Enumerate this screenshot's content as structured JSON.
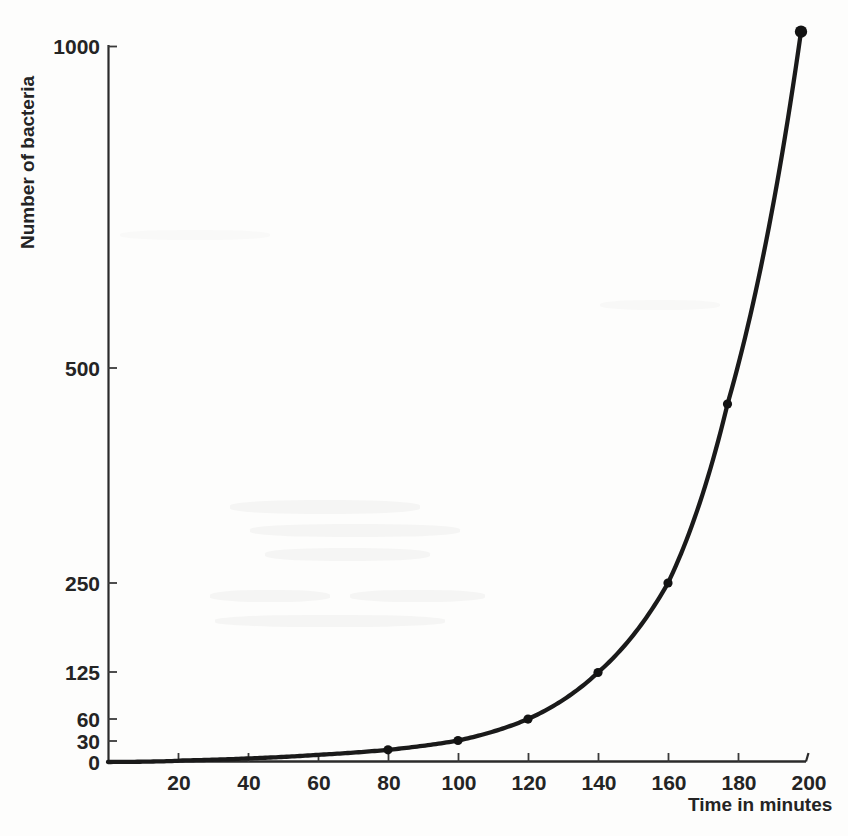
{
  "chart_data": {
    "type": "line",
    "title": "",
    "xlabel": "Time in minutes",
    "ylabel": "Number of bacteria",
    "xlim": [
      0,
      200
    ],
    "ylim": [
      0,
      1000
    ],
    "grid": false,
    "legend": "none",
    "x_ticks": [
      20,
      40,
      60,
      80,
      100,
      120,
      140,
      160,
      180,
      200
    ],
    "x_tick_labels": [
      "20",
      "40",
      "60",
      "80",
      "100",
      "120",
      "140",
      "160",
      "180",
      "200"
    ],
    "y_ticks": [
      0,
      30,
      60,
      125,
      250,
      500,
      1000
    ],
    "y_tick_labels": [
      "0",
      "30",
      "60",
      "125",
      "250",
      "500",
      "1000"
    ],
    "series": [
      {
        "name": "Number of bacteria",
        "marker": "dot",
        "x": [
          0,
          20,
          40,
          60,
          80,
          100,
          120,
          140,
          160,
          177,
          198
        ],
        "y": [
          0,
          2,
          5,
          10,
          17,
          30,
          60,
          125,
          250,
          500,
          1020
        ],
        "marked_points": [
          {
            "x": 80,
            "y": 17
          },
          {
            "x": 100,
            "y": 30
          },
          {
            "x": 120,
            "y": 60
          },
          {
            "x": 140,
            "y": 125
          },
          {
            "x": 160,
            "y": 250
          },
          {
            "x": 177,
            "y": 500
          },
          {
            "x": 198,
            "y": 1020
          }
        ]
      }
    ]
  },
  "axes": {
    "x_title": "Time in minutes",
    "y_title": "Number of bacteria"
  }
}
